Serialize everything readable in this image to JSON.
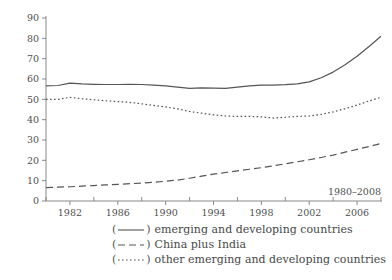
{
  "chart_data": {
    "type": "line",
    "title": "",
    "subtitle": "",
    "xlabel": "",
    "ylabel": "",
    "annotation": "1980–2008",
    "xlim": [
      1980,
      2008
    ],
    "ylim": [
      0,
      90
    ],
    "grid": false,
    "legend_position": "below",
    "yticks": [
      0,
      10,
      20,
      30,
      40,
      50,
      60,
      70,
      80,
      90
    ],
    "ytick_labels": [
      "0",
      "10",
      "20",
      "30",
      "40",
      "50",
      "60",
      "70",
      "80",
      "90"
    ],
    "xticks": [
      1982,
      1986,
      1990,
      1994,
      1998,
      2002,
      2006
    ],
    "xtick_labels": [
      "1982",
      "1986",
      "1990",
      "1994",
      "1998",
      "2002",
      "2006"
    ],
    "xminor_ticks": [
      1980,
      1984,
      1988,
      1992,
      1996,
      2000,
      2004,
      2008
    ],
    "x": [
      1980,
      1981,
      1982,
      1983,
      1984,
      1985,
      1986,
      1987,
      1988,
      1989,
      1990,
      1991,
      1992,
      1993,
      1994,
      1995,
      1996,
      1997,
      1998,
      1999,
      2000,
      2001,
      2002,
      2003,
      2004,
      2005,
      2006,
      2007,
      2008
    ],
    "series": [
      {
        "name": "emerging and developing countries",
        "style": "solid",
        "color": "#555555",
        "values": [
          56.6,
          56.8,
          58.0,
          57.6,
          57.4,
          57.3,
          57.3,
          57.4,
          57.3,
          57.0,
          56.6,
          56.0,
          55.4,
          55.6,
          55.5,
          55.4,
          56.0,
          56.6,
          57.0,
          57.0,
          57.2,
          57.6,
          58.6,
          60.6,
          63.4,
          67.0,
          71.2,
          76.0,
          81.0
        ]
      },
      {
        "name": "China plus India",
        "style": "dashed",
        "color": "#555555",
        "values": [
          6.6,
          6.8,
          7.0,
          7.3,
          7.6,
          7.9,
          8.2,
          8.5,
          8.8,
          9.2,
          9.7,
          10.3,
          11.2,
          12.2,
          13.2,
          14.0,
          14.8,
          15.6,
          16.4,
          17.3,
          18.3,
          19.3,
          20.3,
          21.4,
          22.6,
          24.0,
          25.4,
          26.8,
          28.3
        ]
      },
      {
        "name": "other emerging and developing countries",
        "style": "dotted",
        "color": "#555555",
        "values": [
          50.0,
          50.0,
          51.0,
          50.3,
          49.8,
          49.3,
          48.9,
          48.5,
          47.8,
          47.0,
          46.3,
          45.3,
          44.0,
          43.2,
          42.4,
          41.8,
          41.6,
          41.6,
          41.4,
          40.8,
          41.2,
          41.6,
          41.8,
          42.6,
          43.8,
          45.4,
          47.2,
          49.2,
          51.0
        ]
      }
    ]
  },
  "legend": {
    "open_paren": "(",
    "close_paren": ")",
    "items": [
      {
        "label": "emerging and developing countries",
        "style": "solid"
      },
      {
        "label": "China plus India",
        "style": "dashed"
      },
      {
        "label": "other emerging and developing countries",
        "style": "dotted"
      }
    ]
  }
}
